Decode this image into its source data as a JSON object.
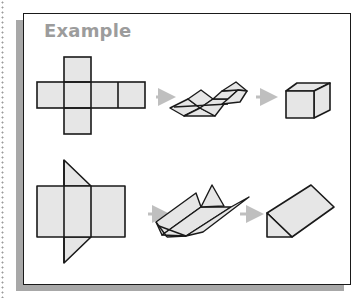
{
  "title": "Example",
  "colors": {
    "title": "#9c9c9c",
    "line": "#1a1a1a",
    "fill": "#e6e6e6",
    "arrow": "#bfbfbf",
    "shadow": "#a8a8a8"
  },
  "rows": [
    {
      "name": "cube",
      "steps": [
        "cube-net",
        "cube-folding",
        "cube"
      ]
    },
    {
      "name": "triangular-prism",
      "steps": [
        "prism-net",
        "prism-folding",
        "triangular-prism"
      ]
    }
  ]
}
